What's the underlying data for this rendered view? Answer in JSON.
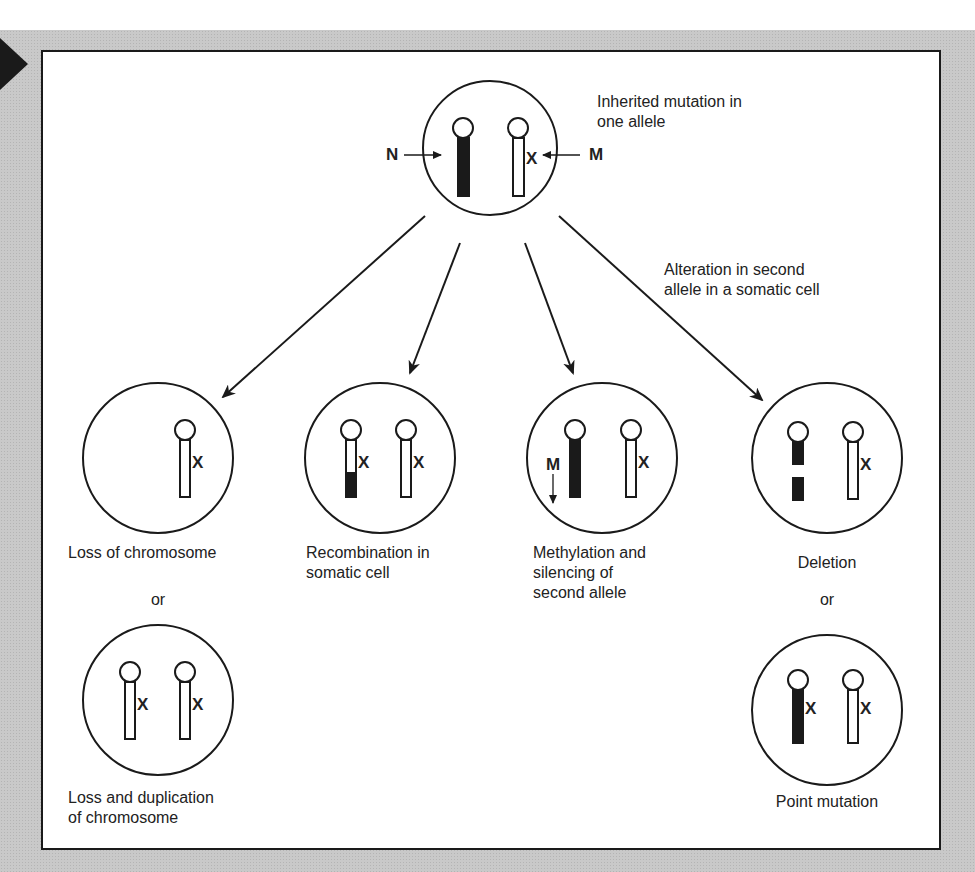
{
  "figure": {
    "topic": "Two-hit mechanism: loss of second allele in a somatic cell",
    "colors": {
      "frame": "#c9c9c9",
      "ink": "#1a1a1a",
      "panel": "#ffffff"
    }
  },
  "top_cell": {
    "caption_line1": "Inherited mutation in",
    "caption_line2": "one allele",
    "normal_label": "N",
    "mutant_label": "M",
    "mutation_mark": "X"
  },
  "branch_label": {
    "line1": "Alteration in second",
    "line2": "allele in a somatic cell"
  },
  "outcomes": [
    {
      "id": "loss",
      "line1": "Loss of chromosome",
      "line2": "",
      "line3": ""
    },
    {
      "id": "recombination",
      "line1": "Recombination in",
      "line2": "somatic cell",
      "line3": ""
    },
    {
      "id": "methylation",
      "line1": "Methylation and",
      "line2": "silencing of",
      "line3": "second allele",
      "marker": "M"
    },
    {
      "id": "deletion",
      "line1": "Deletion",
      "line2": "",
      "line3": ""
    }
  ],
  "alternatives": {
    "or_label": "or",
    "loss_duplication_line1": "Loss and duplication",
    "loss_duplication_line2": "of chromosome",
    "point_mutation": "Point mutation"
  },
  "marks": {
    "x": "X"
  }
}
